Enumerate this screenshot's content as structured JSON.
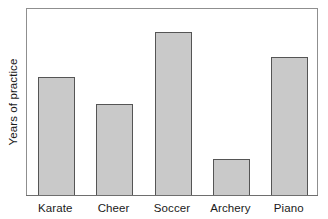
{
  "chart_data": {
    "type": "bar",
    "title": "",
    "xlabel": "",
    "ylabel": "Years of practice",
    "categories": [
      "Karate",
      "Cheer",
      "Soccer",
      "Archery",
      "Piano"
    ],
    "values": [
      0.628,
      0.484,
      0.867,
      0.191,
      0.734
    ],
    "ylim": [
      0,
      1
    ],
    "grid": false,
    "legend": null,
    "axis_tick_labels_y": []
  },
  "axes": {
    "y_title": "Years of practice"
  },
  "colors": {
    "bar_fill": "#c9c9c9",
    "bar_edge": "#555555",
    "frame": "#8f8f8f",
    "axis": "#6e6e6e",
    "background": "#ffffff",
    "text": "#1a1a1a"
  }
}
